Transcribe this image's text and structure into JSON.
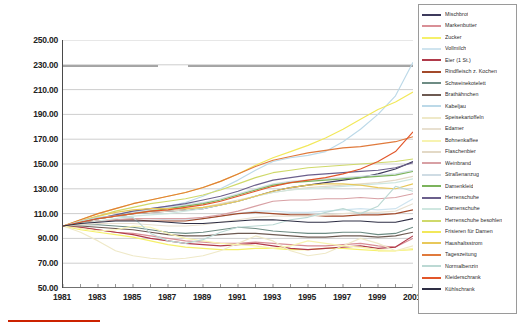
{
  "chart_data": {
    "type": "line",
    "title": "",
    "xlabel": "",
    "ylabel": "",
    "xlim": [
      1981,
      2001
    ],
    "ylim": [
      50,
      250
    ],
    "ytick_step": 20,
    "grid": true,
    "legend_position": "right",
    "base_note": "Index 1981 = 100",
    "x": [
      1981,
      1982,
      1983,
      1984,
      1985,
      1986,
      1987,
      1988,
      1989,
      1990,
      1991,
      1992,
      1993,
      1994,
      1995,
      1996,
      1997,
      1998,
      1999,
      2000,
      2001
    ],
    "yticks": [
      "50.00",
      "70.00",
      "90.00",
      "110.00",
      "130.00",
      "150.00",
      "170.00",
      "190.00",
      "210.00",
      "230.00",
      "250.00"
    ],
    "xticks": [
      "1981",
      "1983",
      "1985",
      "1987",
      "1989",
      "1991",
      "1993",
      "1995",
      "1997",
      "1999",
      "2001"
    ],
    "series": [
      {
        "name": "Mischbrot",
        "color": "#3d3a5c",
        "values": [
          100,
          103,
          106,
          108,
          110,
          111,
          112,
          113,
          114,
          117,
          120,
          124,
          128,
          131,
          133,
          135,
          137,
          139,
          142,
          146,
          152
        ]
      },
      {
        "name": "Markenbutter",
        "color": "#d98f96",
        "values": [
          100,
          99,
          97,
          95,
          94,
          92,
          90,
          88,
          87,
          86,
          86,
          87,
          86,
          85,
          84,
          84,
          85,
          86,
          84,
          83,
          90
        ]
      },
      {
        "name": "Zucker",
        "color": "#f5f06a",
        "values": [
          100,
          97,
          95,
          93,
          91,
          88,
          85,
          83,
          82,
          81,
          81,
          82,
          82,
          81,
          81,
          82,
          82,
          81,
          80,
          80,
          81
        ]
      },
      {
        "name": "Vollmilch",
        "color": "#cfe4ef",
        "values": [
          100,
          102,
          104,
          105,
          106,
          106,
          105,
          105,
          106,
          108,
          110,
          112,
          112,
          111,
          111,
          112,
          113,
          114,
          113,
          114,
          122
        ]
      },
      {
        "name": "Eier (1 St.)",
        "color": "#b03a4a",
        "values": [
          100,
          99,
          97,
          95,
          93,
          90,
          88,
          86,
          85,
          84,
          85,
          86,
          84,
          82,
          81,
          82,
          83,
          84,
          82,
          83,
          92
        ]
      },
      {
        "name": "Rindfleisch z. Kochen",
        "color": "#a34a2a",
        "values": [
          100,
          103,
          104,
          105,
          105,
          104,
          104,
          104,
          106,
          108,
          110,
          111,
          110,
          109,
          109,
          108,
          108,
          109,
          109,
          110,
          113
        ]
      },
      {
        "name": "Schweinekotelett",
        "color": "#6e8c84",
        "values": [
          100,
          101,
          101,
          100,
          99,
          97,
          95,
          94,
          95,
          97,
          99,
          98,
          96,
          95,
          94,
          94,
          95,
          95,
          93,
          94,
          99
        ]
      },
      {
        "name": "Brathähnchen",
        "color": "#6d5a52",
        "values": [
          100,
          100,
          99,
          98,
          97,
          95,
          93,
          92,
          92,
          93,
          94,
          94,
          93,
          92,
          91,
          91,
          92,
          92,
          91,
          92,
          95
        ]
      },
      {
        "name": "Kabeljau",
        "color": "#bcd9e8",
        "values": [
          100,
          103,
          106,
          109,
          112,
          114,
          116,
          119,
          124,
          130,
          137,
          145,
          152,
          155,
          157,
          160,
          168,
          178,
          190,
          205,
          232
        ]
      },
      {
        "name": "Speisekartoffeln",
        "color": "#efe9c8",
        "values": [
          100,
          95,
          88,
          80,
          76,
          74,
          73,
          74,
          76,
          80,
          86,
          92,
          88,
          80,
          76,
          78,
          84,
          90,
          86,
          80,
          84
        ]
      },
      {
        "name": "Edamer",
        "color": "#e8e0d0",
        "values": [
          100,
          101,
          102,
          102,
          102,
          101,
          100,
          100,
          101,
          103,
          105,
          107,
          108,
          108,
          108,
          109,
          110,
          111,
          111,
          112,
          118
        ]
      },
      {
        "name": "Bohnenkaffee",
        "color": "#f7f3b0",
        "values": [
          100,
          98,
          96,
          97,
          100,
          99,
          94,
          90,
          88,
          86,
          85,
          84,
          82,
          84,
          88,
          86,
          84,
          83,
          81,
          80,
          82
        ]
      },
      {
        "name": "Flaschenbier",
        "color": "#e3d9c6",
        "values": [
          100,
          103,
          106,
          108,
          110,
          111,
          112,
          113,
          115,
          118,
          121,
          124,
          127,
          129,
          131,
          132,
          133,
          134,
          135,
          137,
          140
        ]
      },
      {
        "name": "Weinbrand",
        "color": "#d8a0a4",
        "values": [
          100,
          102,
          104,
          105,
          106,
          106,
          106,
          106,
          107,
          109,
          112,
          116,
          120,
          121,
          121,
          122,
          122,
          123,
          122,
          123,
          126
        ]
      },
      {
        "name": "Straßenanzug",
        "color": "#cfdce4",
        "values": [
          100,
          103,
          106,
          109,
          111,
          113,
          115,
          117,
          119,
          122,
          126,
          130,
          134,
          136,
          137,
          138,
          139,
          140,
          141,
          142,
          145
        ]
      },
      {
        "name": "Damenkleid",
        "color": "#7cb35c",
        "values": [
          100,
          103,
          106,
          108,
          110,
          112,
          114,
          116,
          118,
          121,
          125,
          129,
          133,
          135,
          136,
          137,
          138,
          139,
          140,
          141,
          144
        ]
      },
      {
        "name": "Herrenschuhe",
        "color": "#6b5f8c",
        "values": [
          100,
          103,
          106,
          109,
          112,
          114,
          116,
          118,
          121,
          124,
          128,
          133,
          137,
          139,
          141,
          142,
          143,
          144,
          145,
          147,
          151
        ]
      },
      {
        "name": "Damenschuhe",
        "color": "#cfe7e0",
        "values": [
          100,
          102,
          104,
          106,
          108,
          109,
          110,
          112,
          114,
          117,
          120,
          124,
          127,
          129,
          130,
          131,
          132,
          133,
          134,
          135,
          138
        ]
      },
      {
        "name": "Herrenschuhe besohlen",
        "color": "#cfd96a",
        "values": [
          100,
          104,
          108,
          112,
          115,
          118,
          120,
          122,
          125,
          129,
          134,
          139,
          143,
          145,
          147,
          148,
          149,
          150,
          151,
          152,
          154
        ]
      },
      {
        "name": "Frisieren für Damen",
        "color": "#f2e85a",
        "values": [
          100,
          105,
          110,
          114,
          118,
          121,
          124,
          127,
          131,
          136,
          142,
          149,
          155,
          160,
          165,
          171,
          178,
          186,
          194,
          200,
          208
        ]
      },
      {
        "name": "Haushaltsstrom",
        "color": "#e8c85a",
        "values": [
          100,
          104,
          108,
          111,
          113,
          114,
          114,
          114,
          115,
          117,
          120,
          124,
          128,
          131,
          133,
          134,
          134,
          133,
          131,
          130,
          134
        ]
      },
      {
        "name": "Tageszeitung",
        "color": "#e07a3c",
        "values": [
          100,
          105,
          110,
          114,
          118,
          121,
          124,
          127,
          131,
          136,
          142,
          148,
          153,
          156,
          159,
          161,
          163,
          164,
          166,
          168,
          172
        ]
      },
      {
        "name": "Normalbenzin",
        "color": "#bcd9d4",
        "values": [
          100,
          104,
          107,
          108,
          107,
          94,
          88,
          86,
          89,
          95,
          99,
          100,
          101,
          105,
          107,
          111,
          114,
          110,
          116,
          132,
          128
        ]
      },
      {
        "name": "Kleiderschrank",
        "color": "#e2562a",
        "values": [
          100,
          103,
          106,
          108,
          110,
          112,
          113,
          115,
          117,
          120,
          124,
          128,
          132,
          135,
          137,
          139,
          142,
          146,
          152,
          160,
          176
        ]
      },
      {
        "name": "Kühlschrank",
        "color": "#2e2e44",
        "values": [
          100,
          102,
          103,
          104,
          104,
          104,
          103,
          102,
          102,
          103,
          104,
          105,
          105,
          104,
          103,
          103,
          104,
          104,
          103,
          103,
          106
        ]
      }
    ]
  },
  "legend": {
    "items": [
      {
        "label": "Mischbrot"
      },
      {
        "label": "Markenbutter"
      },
      {
        "label": "Zucker"
      },
      {
        "label": "Vollmilch"
      },
      {
        "label": "Eier (1 St.)"
      },
      {
        "label": "Rindfleisch z. Kochen"
      },
      {
        "label": "Schweinekotelett"
      },
      {
        "label": "Brathähnchen"
      },
      {
        "label": "Kabeljau"
      },
      {
        "label": "Speisekartoffeln"
      },
      {
        "label": "Edamer"
      },
      {
        "label": "Bohnenkaffee"
      },
      {
        "label": "Flaschenbier"
      },
      {
        "label": "Weinbrand"
      },
      {
        "label": "Straßenanzug"
      },
      {
        "label": "Damenkleid"
      },
      {
        "label": "Herrenschuhe"
      },
      {
        "label": "Damenschuhe"
      },
      {
        "label": "Herrenschuhe besohlen"
      },
      {
        "label": "Frisieren für Damen"
      },
      {
        "label": "Haushaltsstrom"
      },
      {
        "label": "Tageszeitung"
      },
      {
        "label": "Normalbenzin"
      },
      {
        "label": "Kleiderschrank"
      },
      {
        "label": "Kühlschrank"
      }
    ]
  }
}
